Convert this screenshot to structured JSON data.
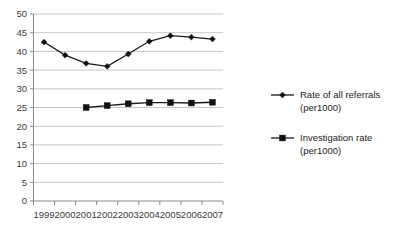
{
  "chart_data": {
    "type": "line",
    "title": "",
    "subtitle": "",
    "xlabel": "",
    "ylabel": "",
    "categories": [
      "1999",
      "2000",
      "2001",
      "2002",
      "2003",
      "2004",
      "2005",
      "2006",
      "2007"
    ],
    "ylim": [
      0,
      50
    ],
    "ytick_labels": [
      "0",
      "5",
      "10",
      "15",
      "20",
      "25",
      "30",
      "35",
      "40",
      "45",
      "50"
    ],
    "ytick_values": [
      0,
      5,
      10,
      15,
      20,
      25,
      30,
      35,
      40,
      45,
      50
    ],
    "grid": "horizontal",
    "legend_position": "right",
    "series": [
      {
        "name": "Rate of all referrals (per1000)",
        "marker": "diamond",
        "color": "#111111",
        "x": [
          "1999",
          "2000",
          "2001",
          "2002",
          "2003",
          "2004",
          "2005",
          "2006",
          "2007"
        ],
        "values": [
          42.5,
          39.0,
          36.8,
          36.0,
          39.3,
          42.7,
          44.2,
          43.8,
          43.3
        ]
      },
      {
        "name": "Investigation rate (per1000)",
        "marker": "square",
        "color": "#111111",
        "x": [
          "2001",
          "2002",
          "2003",
          "2004",
          "2005",
          "2006",
          "2007"
        ],
        "values": [
          25.0,
          25.5,
          26.0,
          26.3,
          26.3,
          26.2,
          26.4
        ]
      }
    ]
  },
  "legend": {
    "entries": [
      {
        "line1": "Rate of all referrals",
        "line2": "(per1000)",
        "marker": "diamond"
      },
      {
        "line1": "Investigation rate",
        "line2": "(per1000)",
        "marker": "square"
      }
    ]
  },
  "axes": {
    "y_labels": [
      "50",
      "45",
      "40",
      "35",
      "30",
      "25",
      "20",
      "15",
      "10",
      "5",
      "0"
    ],
    "x_labels": [
      "1999",
      "2000",
      "2001",
      "2002",
      "2003",
      "2004",
      "2005",
      "2006",
      "2007"
    ]
  }
}
